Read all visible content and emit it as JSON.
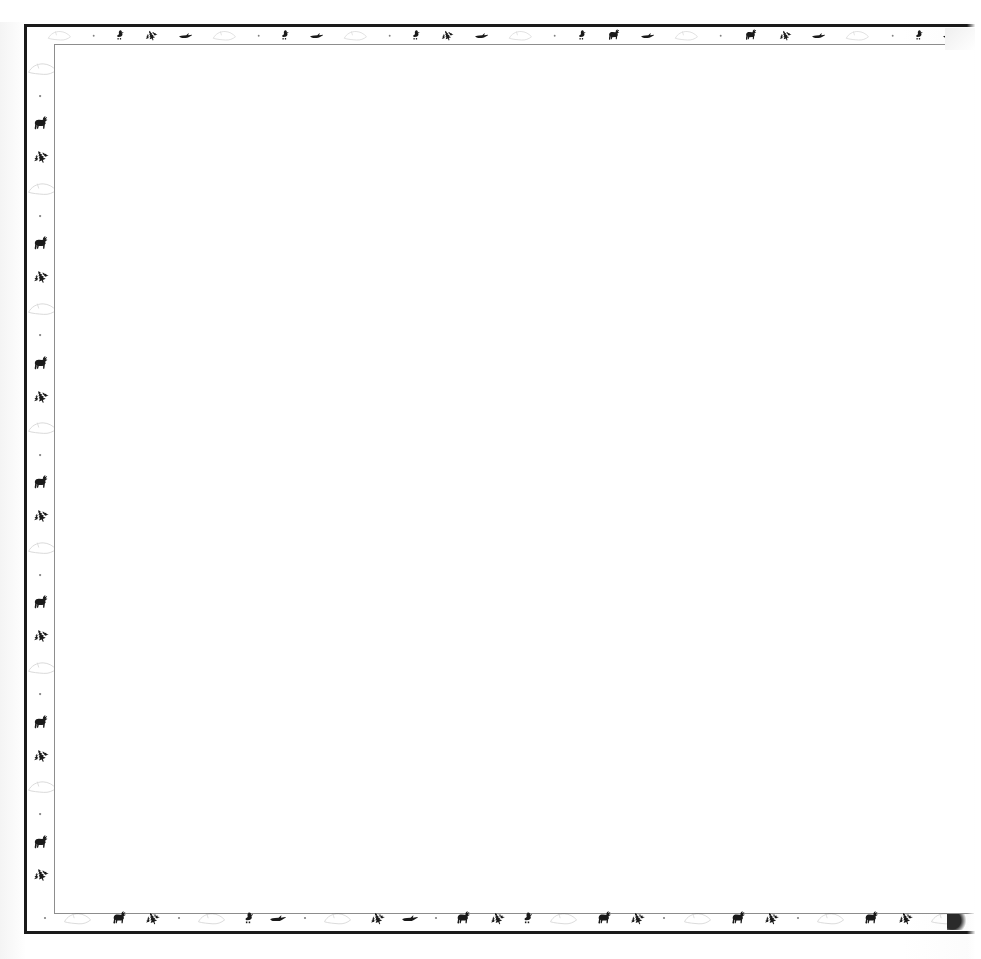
{
  "document": {
    "kind": "scanned-decorative-stationery",
    "page_title": "",
    "body_text": "",
    "background_color": "#ffffff",
    "ink_color": "#1a1a1a",
    "inner_rule_color": "#8d8d8d"
  },
  "frame": {
    "outer_rule_label": "outer-border-rule",
    "inner_rule_label": "inner-border-rule",
    "writing_area_label": "blank-writing-area",
    "right_edge_state": "cut-off"
  },
  "motifs": {
    "moose": "moose-icon",
    "pine": "pine-tree-icon",
    "duck_standing": "standing-duck-icon",
    "duck_flying": "flying-duck-icon",
    "leaf_ghost": "faint-leaf-icon",
    "speck": "ink-speck-icon"
  },
  "border": {
    "top_sequence": [
      "leaf_ghost",
      "speck",
      "duck_standing",
      "pine",
      "duck_flying",
      "leaf_ghost",
      "speck",
      "duck_standing",
      "duck_flying",
      "leaf_ghost",
      "speck",
      "duck_standing",
      "pine",
      "duck_flying",
      "leaf_ghost",
      "speck",
      "duck_standing",
      "moose",
      "duck_flying",
      "leaf_ghost",
      "speck",
      "moose",
      "pine",
      "duck_flying",
      "leaf_ghost",
      "speck",
      "duck_standing",
      "duck_flying"
    ],
    "bottom_sequence": [
      "speck",
      "leaf_ghost",
      "moose",
      "pine",
      "speck",
      "leaf_ghost",
      "duck_standing",
      "duck_flying",
      "speck",
      "leaf_ghost",
      "pine",
      "duck_flying",
      "speck",
      "moose",
      "pine",
      "duck_standing",
      "leaf_ghost",
      "moose",
      "pine",
      "speck",
      "leaf_ghost",
      "moose",
      "pine",
      "speck",
      "leaf_ghost",
      "moose",
      "pine",
      "leaf_ghost"
    ],
    "left_sequence": [
      "leaf_ghost",
      "speck",
      "moose",
      "pine",
      "leaf_ghost",
      "speck",
      "moose",
      "pine",
      "leaf_ghost",
      "speck",
      "moose",
      "pine",
      "leaf_ghost",
      "speck",
      "moose",
      "pine",
      "leaf_ghost",
      "speck",
      "moose",
      "pine",
      "leaf_ghost",
      "speck",
      "moose",
      "pine",
      "leaf_ghost",
      "speck",
      "moose",
      "pine"
    ]
  }
}
